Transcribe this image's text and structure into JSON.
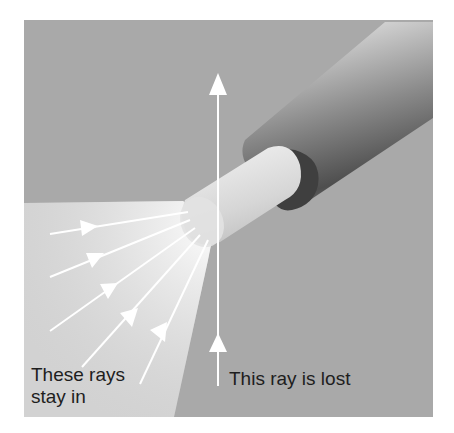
{
  "diagram": {
    "labels": {
      "rays_in_line1": "These rays",
      "rays_in_line2": "stay in",
      "ray_lost": "This ray is lost"
    },
    "colors": {
      "background": "#a9a9a9",
      "cone_light": "#d4d4d4",
      "cone_highlight": "#f2f2f2",
      "core": "#d9d9d9",
      "cladding_light": "#c8c8c8",
      "cladding_dark": "#4a4a4a",
      "arrow": "#ffffff",
      "text": "#1e1e1e"
    },
    "elements": [
      {
        "name": "optical-fiber-core",
        "type": "cylinder"
      },
      {
        "name": "fiber-cladding",
        "type": "cylinder"
      },
      {
        "name": "acceptance-cone",
        "type": "light-region"
      },
      {
        "name": "accepted-rays",
        "count": 5
      },
      {
        "name": "lost-ray",
        "count": 1
      }
    ]
  }
}
